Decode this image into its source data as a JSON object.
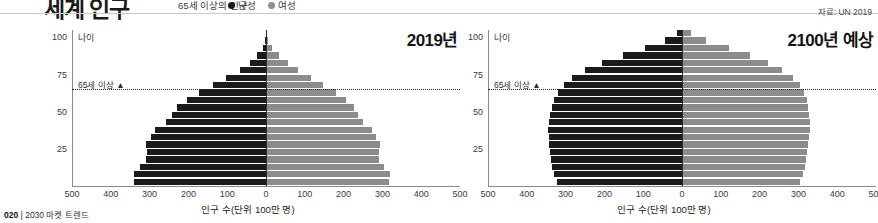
{
  "header": {
    "title": "세계 인구",
    "subtitle": "65세 이상의 인구",
    "legend": [
      {
        "label": "남성",
        "color": "#1c1c1c",
        "icon": "male-dot-icon"
      },
      {
        "label": "여성",
        "color": "#8f8f8f",
        "icon": "female-dot-icon"
      }
    ],
    "source": "자료: UN 2019"
  },
  "footer": {
    "page": "020",
    "separator": "|",
    "book": "2030 마켓 트렌드"
  },
  "common": {
    "y_axis_label": "나이",
    "marker_65_label": "65세 이상 ▲",
    "x_axis_label": "인구 수(단위 100만 명)",
    "x_ticks": [
      "500",
      "400",
      "300",
      "200",
      "100",
      "0",
      "100",
      "200",
      "300",
      "400",
      "500"
    ],
    "y_ticks": [
      "100",
      "75",
      "50",
      "25"
    ],
    "male_color": "#1b1b1b",
    "female_color": "#8c8c8c"
  },
  "chart_data": [
    {
      "type": "bar",
      "id": "pyramid-2019",
      "title": "2019년",
      "xlabel": "인구 수(단위 100만 명)",
      "ylabel": "나이",
      "xlim": [
        -500,
        500
      ],
      "ylim": [
        0,
        105
      ],
      "grid": false,
      "legend_position": "top",
      "annotations": [
        "65세 이상 ▲"
      ],
      "age_bands": [
        "0-4",
        "5-9",
        "10-14",
        "15-19",
        "20-24",
        "25-29",
        "30-34",
        "35-39",
        "40-44",
        "45-49",
        "50-54",
        "55-59",
        "60-64",
        "65-69",
        "70-74",
        "75-79",
        "80-84",
        "85-89",
        "90-94",
        "95-99",
        "100+"
      ],
      "series": [
        {
          "name": "남성",
          "color": "#1b1b1b",
          "values": [
            339,
            340,
            324,
            309,
            308,
            310,
            296,
            285,
            258,
            243,
            230,
            203,
            172,
            136,
            102,
            68,
            42,
            22,
            9,
            2,
            0.4
          ]
        },
        {
          "name": "여성",
          "color": "#8c8c8c",
          "values": [
            318,
            319,
            304,
            290,
            290,
            294,
            283,
            274,
            250,
            238,
            228,
            205,
            180,
            148,
            117,
            83,
            56,
            33,
            16,
            5,
            1.2
          ]
        }
      ]
    },
    {
      "type": "bar",
      "id": "pyramid-2100",
      "title": "2100년 예상",
      "xlabel": "인구 수(단위 100만 명)",
      "ylabel": "나이",
      "xlim": [
        -500,
        500
      ],
      "ylim": [
        0,
        105
      ],
      "grid": false,
      "legend_position": "top",
      "annotations": [
        "65세 이상 ▲"
      ],
      "age_bands": [
        "0-4",
        "5-9",
        "10-14",
        "15-19",
        "20-24",
        "25-29",
        "30-34",
        "35-39",
        "40-44",
        "45-49",
        "50-54",
        "55-59",
        "60-64",
        "65-69",
        "70-74",
        "75-79",
        "80-84",
        "85-89",
        "90-94",
        "95-99",
        "100+"
      ],
      "series": [
        {
          "name": "남성",
          "color": "#1b1b1b",
          "values": [
            322,
            330,
            335,
            338,
            340,
            342,
            344,
            345,
            344,
            341,
            336,
            330,
            320,
            305,
            283,
            250,
            205,
            152,
            96,
            44,
            13
          ]
        },
        {
          "name": "여성",
          "color": "#8c8c8c",
          "values": [
            303,
            311,
            316,
            319,
            321,
            324,
            327,
            329,
            329,
            328,
            325,
            321,
            314,
            303,
            286,
            259,
            221,
            174,
            120,
            62,
            22
          ]
        }
      ]
    }
  ]
}
